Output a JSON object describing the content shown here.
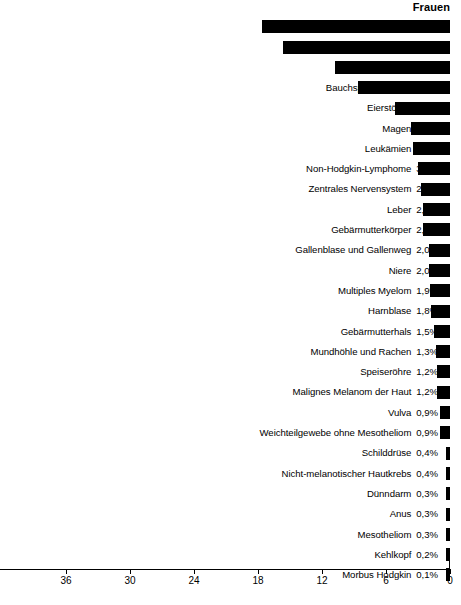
{
  "chart_data": {
    "type": "bar",
    "orientation": "horizontal-right-to-left",
    "title": "Frauen",
    "xlabel": "",
    "ylabel": "",
    "xlim": [
      0,
      42.2
    ],
    "xticks": [
      36,
      30,
      24,
      18,
      12,
      6,
      0
    ],
    "xtick_labels": [
      "36",
      "30",
      "24",
      "18",
      "12",
      "6",
      "0"
    ],
    "grid": false,
    "legend": false,
    "value_suffix": "%",
    "decimal_separator": ",",
    "bar_color": "#000000",
    "categories": [
      "Brustdrüse",
      "Lunge",
      "Darm",
      "Bauchspeicheldrüse",
      "Eierstöcke",
      "Magen",
      "Leukämien",
      "Non-Hodgkin-Lymphome",
      "Zentrales Nervensystem",
      "Leber",
      "Gebärmutterkörper",
      "Gallenblase und Gallenweg",
      "Niere",
      "Multiples Myelom",
      "Harnblase",
      "Gebärmutterhals",
      "Mundhöhle und Rachen",
      "Speiseröhre",
      "Malignes Melanom der Haut",
      "Vulva",
      "Weichteilgewebe ohne Mesotheliom",
      "Schilddrüse",
      "Nicht-melanotischer Hautkrebs",
      "Dünndarm",
      "Anus",
      "Mesotheliom",
      "Kehlkopf",
      "Morbus Hodgkin"
    ],
    "values": [
      17.6,
      15.7,
      10.8,
      8.6,
      5.2,
      3.7,
      3.5,
      3.0,
      2.7,
      2.5,
      2.5,
      2.0,
      2.0,
      1.9,
      1.8,
      1.5,
      1.3,
      1.2,
      1.2,
      0.9,
      0.9,
      0.4,
      0.4,
      0.3,
      0.3,
      0.3,
      0.2,
      0.1
    ],
    "value_labels": [
      "17,6%",
      "15,7%",
      "10,8%",
      "8,6%",
      "5,2%",
      "3,7%",
      "3,5%",
      "3,0%",
      "2,7%",
      "2,5%",
      "2,5%",
      "2,0%",
      "2,0%",
      "1,9%",
      "1,8%",
      "1,5%",
      "1,3%",
      "1,2%",
      "1,2%",
      "0,9%",
      "0,9%",
      "0,4%",
      "0,4%",
      "0,3%",
      "0,3%",
      "0,3%",
      "0,2%",
      "0,1%"
    ]
  }
}
